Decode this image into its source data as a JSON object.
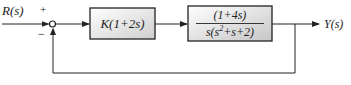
{
  "diagram": {
    "type": "feedback-block-diagram",
    "input_label": "R(s)",
    "output_label": "Y(s)",
    "summing_junction": {
      "plus_sign": "+",
      "minus_sign": "−"
    },
    "blocks": [
      {
        "id": "controller",
        "label": "K(1+2s)",
        "colors": {
          "fill_top": "#ffffff",
          "fill_bottom": "#d0d0d0",
          "stroke": "#222222"
        }
      },
      {
        "id": "plant",
        "numerator": "(1+4s)",
        "denominator_prefix": "s(s",
        "denominator_exp": "2",
        "denominator_suffix": "+s+2)",
        "colors": {
          "fill_top": "#ffffff",
          "fill_bottom": "#c8c8c8",
          "stroke": "#222222"
        }
      }
    ],
    "feedback": "unity negative feedback from Y(s) to summing junction",
    "line_color": "#222222"
  }
}
